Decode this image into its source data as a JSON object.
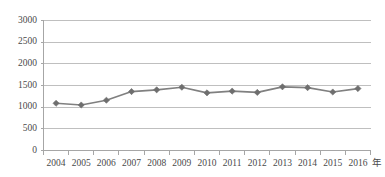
{
  "chart_data": {
    "type": "line",
    "title": "",
    "subtitle": "",
    "xlabel": "年",
    "ylabel": "",
    "categories": [
      "2004",
      "2005",
      "2006",
      "2007",
      "2008",
      "2009",
      "2010",
      "2011",
      "2012",
      "2013",
      "2014",
      "2015",
      "2016"
    ],
    "values": [
      1090,
      1050,
      1160,
      1360,
      1400,
      1460,
      1330,
      1370,
      1340,
      1470,
      1450,
      1350,
      1430
    ],
    "series": [
      {
        "name": "",
        "values": [
          1090,
          1050,
          1160,
          1360,
          1400,
          1460,
          1330,
          1370,
          1340,
          1470,
          1450,
          1350,
          1430
        ]
      }
    ],
    "ylim": [
      0,
      3000
    ],
    "yticks": [
      0,
      500,
      1000,
      1500,
      2000,
      2500,
      3000
    ],
    "ytick_labels": [
      "0",
      "500",
      "1000",
      "1500",
      "2000",
      "2500",
      "3000"
    ],
    "xtick_labels": [
      "2004",
      "2005",
      "2006",
      "2007",
      "2008",
      "2009",
      "2010",
      "2011",
      "2012",
      "2013",
      "2014",
      "2015",
      "2016"
    ],
    "grid": true,
    "grid_axis": "y",
    "legend": false,
    "legend_position": "none",
    "marker": "diamond",
    "annotations": []
  },
  "style": {
    "line_color": "#808080",
    "marker_color": "#6e6e6e",
    "grid_color": "#bfbfbf",
    "axis_color": "#a6a6a6",
    "tick_color": "#a6a6a6",
    "label_color": "#4a4a4a",
    "background": "#ffffff"
  },
  "axis_unit_label": "年"
}
